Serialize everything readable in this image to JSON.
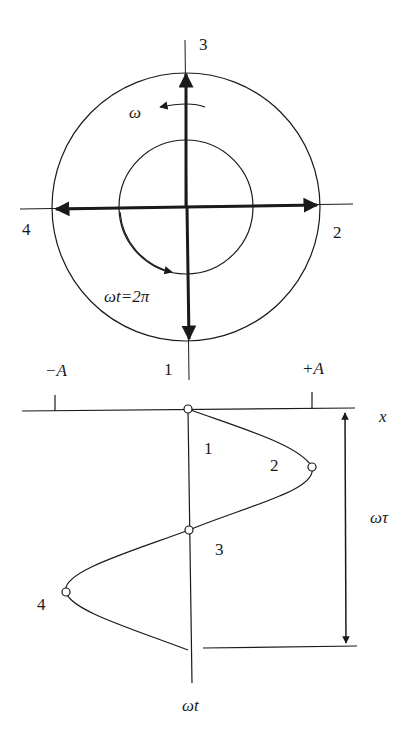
{
  "diagram": {
    "colors": {
      "ink": "#1a1a1a",
      "background": "#ffffff"
    },
    "phasor": {
      "position_labels": {
        "top": "3",
        "right": "2",
        "left": "4",
        "bottom": "1"
      },
      "angular_velocity_label": "ω",
      "full_rotation_label": "ωt=2π"
    },
    "projection": {
      "amplitude_labels": {
        "negative": "−A",
        "positive": "+A"
      },
      "axis_top_label": "1",
      "x_axis_label": "x",
      "time_axis_label": "ωt",
      "period_label": "ωτ",
      "point_labels": [
        "1",
        "2",
        "3",
        "4"
      ]
    }
  }
}
